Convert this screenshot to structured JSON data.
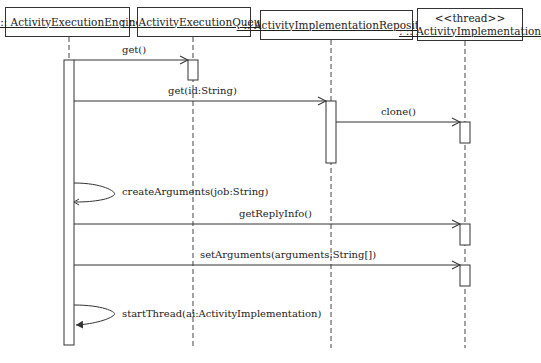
{
  "diagram": {
    "type": "UML sequence diagram",
    "lifelines": [
      {
        "id": "engine",
        "name": ": :: ActivityExecutionEngine",
        "stereotype": ""
      },
      {
        "id": "queue",
        "name": ": :: ActivityExecutionQueue",
        "stereotype": ""
      },
      {
        "id": "repository",
        "name": ": :: ActivityImplementationRepository",
        "stereotype": ""
      },
      {
        "id": "implementation",
        "name": ": :: ActivityImplementation",
        "stereotype": "<<thread>>"
      }
    ],
    "messages": [
      {
        "from": "engine",
        "to": "queue",
        "label": "get()"
      },
      {
        "from": "engine",
        "to": "repository",
        "label": "get(id:String)"
      },
      {
        "from": "repository",
        "to": "implementation",
        "label": "clone()"
      },
      {
        "from": "engine",
        "to": "engine",
        "label": "createArguments(job:String)"
      },
      {
        "from": "engine",
        "to": "implementation",
        "label": "getReplyInfo()"
      },
      {
        "from": "engine",
        "to": "implementation",
        "label": "setArguments(arguments:String[])"
      },
      {
        "from": "engine",
        "to": "engine",
        "label": "startThread(ai:ActivityImplementation)"
      }
    ]
  }
}
